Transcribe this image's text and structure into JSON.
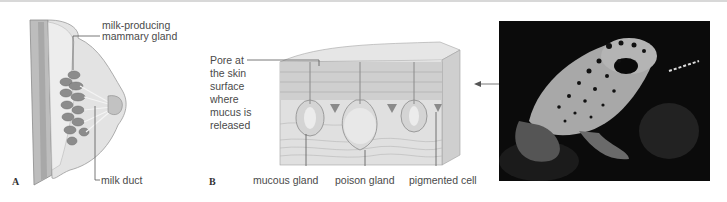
{
  "figure": {
    "panel_a": {
      "letter": "A",
      "labels": {
        "mammary_gland_line1": "milk-producing",
        "mammary_gland_line2": "mammary gland",
        "milk_duct": "milk duct"
      }
    },
    "panel_b": {
      "letter": "B",
      "labels": {
        "pore_lines": [
          "Pore at",
          "the skin",
          "surface",
          "where",
          "mucus is",
          "released"
        ],
        "mucous_gland": "mucous gland",
        "poison_gland": "poison gland",
        "pigmented_cell": "pigmented cell"
      }
    },
    "photo": {
      "subject": "poison dart frog"
    },
    "colors": {
      "label_text": "#4a4a4a",
      "leader_line": "#555555",
      "illustration_fill": "#d9d9d9",
      "photo_background": "#0a0a0a"
    }
  }
}
